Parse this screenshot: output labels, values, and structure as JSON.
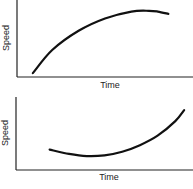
{
  "chart_data": [
    {
      "type": "line",
      "title": "",
      "xlabel": "Time",
      "ylabel": "Speed",
      "grid": false,
      "xlim": [
        0,
        1
      ],
      "ylim": [
        0,
        1
      ],
      "series": [
        {
          "name": "speed",
          "x": [
            0.09,
            0.2,
            0.35,
            0.5,
            0.65,
            0.75,
            0.8,
            0.86
          ],
          "y": [
            0.05,
            0.35,
            0.6,
            0.76,
            0.85,
            0.86,
            0.85,
            0.82
          ]
        }
      ]
    },
    {
      "type": "line",
      "title": "",
      "xlabel": "Time",
      "ylabel": "Speed",
      "grid": false,
      "xlim": [
        0,
        1
      ],
      "ylim": [
        0,
        1
      ],
      "series": [
        {
          "name": "speed",
          "x": [
            0.19,
            0.3,
            0.4,
            0.5,
            0.6,
            0.7,
            0.8,
            0.9,
            0.95
          ],
          "y": [
            0.28,
            0.22,
            0.19,
            0.2,
            0.25,
            0.34,
            0.47,
            0.67,
            0.82
          ]
        }
      ]
    }
  ]
}
